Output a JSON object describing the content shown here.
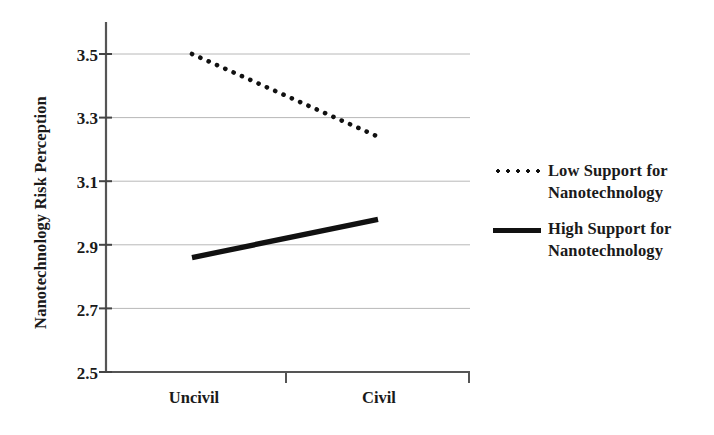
{
  "chart_data": {
    "type": "line",
    "title": "",
    "xlabel": "",
    "ylabel": "Nanotechnology Risk Perception",
    "categories": [
      "Uncivil",
      "Civil"
    ],
    "yticks": [
      "3.5",
      "3.3",
      "3.1",
      "2.9",
      "2.7",
      "2.5"
    ],
    "ylim": [
      2.5,
      3.5
    ],
    "grid": true,
    "legend_position": "right",
    "series": [
      {
        "name": "Low Support for Nanotechnology",
        "style": "dotted",
        "color": "#111111",
        "values": [
          3.5,
          3.24
        ]
      },
      {
        "name": "High Support for Nanotechnology",
        "style": "solid",
        "color": "#111111",
        "values": [
          2.86,
          2.98
        ]
      }
    ]
  },
  "axis": {
    "y_title": "Nanotechnology Risk Perception",
    "y_ticks": [
      {
        "label": "3.5",
        "value": 3.5
      },
      {
        "label": "3.3",
        "value": 3.3
      },
      {
        "label": "3.1",
        "value": 3.1
      },
      {
        "label": "2.9",
        "value": 2.9
      },
      {
        "label": "2.7",
        "value": 2.7
      },
      {
        "label": "2.5",
        "value": 2.5
      }
    ],
    "x_ticks": [
      {
        "label": "Uncivil"
      },
      {
        "label": "Civil"
      }
    ]
  },
  "legend": {
    "items": [
      {
        "label_line1": "Low Support for",
        "label_line2": "Nanotechnology",
        "style": "dotted"
      },
      {
        "label_line1": "High Support for",
        "label_line2": "Nanotechnology",
        "style": "solid"
      }
    ]
  },
  "colors": {
    "ink": "#111111",
    "grid": "#b8b8b8",
    "axis": "#555555",
    "background": "#ffffff"
  }
}
